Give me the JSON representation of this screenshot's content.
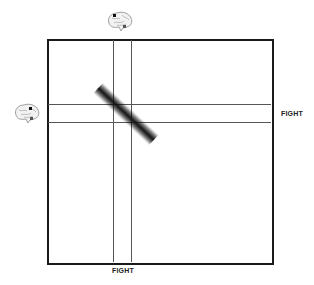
{
  "diagram": {
    "x_axis_label": "FIGHT",
    "y_axis_label": "FIGHT",
    "icons": [
      "brain-icon-top",
      "brain-icon-left"
    ],
    "lines": {
      "vertical": [
        113,
        131
      ],
      "horizontal": [
        104,
        122
      ]
    }
  }
}
